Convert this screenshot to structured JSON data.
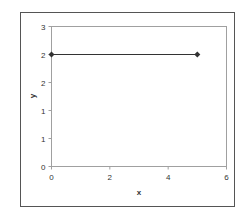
{
  "chart_data": {
    "type": "line",
    "title": "",
    "xlabel": "x",
    "ylabel": "y",
    "xlim": [
      0,
      6
    ],
    "ylim": [
      0,
      3
    ],
    "x_ticks": [
      0,
      2,
      4,
      6
    ],
    "x_tick_labels": [
      "0",
      "2",
      "4",
      "6"
    ],
    "y_ticks": [
      0,
      0.6,
      1.2,
      1.8,
      2.4,
      3.0
    ],
    "y_tick_labels": [
      "0",
      "1",
      "1",
      "2",
      "2",
      "3"
    ],
    "grid": false,
    "legend": null,
    "series": [
      {
        "name": "Series 1",
        "x": [
          0,
          5
        ],
        "y": [
          2.4,
          2.4
        ],
        "marker": "diamond",
        "color": "#333333"
      }
    ]
  },
  "style": {
    "outer_border_color": "#555555",
    "plot_border_color": "#999999",
    "line_color": "#333333",
    "background": "#ffffff"
  }
}
